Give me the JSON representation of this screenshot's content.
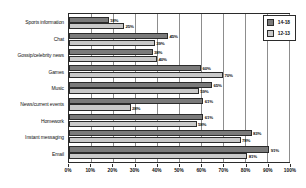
{
  "chart_data": {
    "type": "bar",
    "orientation": "horizontal",
    "title": "",
    "xlabel": "",
    "ylabel": "",
    "xlim": [
      0,
      100
    ],
    "grid": true,
    "legend_position": "top-right",
    "categories": [
      "Sports information",
      "Chat",
      "Gossip/celebrity news",
      "Games",
      "Music",
      "News/current events",
      "Homework",
      "Instant messaging",
      "Email"
    ],
    "series": [
      {
        "name": "14-18",
        "color": "#7a7a7a",
        "values": [
          18,
          45,
          38,
          60,
          65,
          61,
          61,
          83,
          91
        ],
        "labels": [
          "18%",
          "45%",
          "38%",
          "60%",
          "65%",
          "61%",
          "61%",
          "83%",
          "91%"
        ]
      },
      {
        "name": "12-13",
        "color": "#c9c9c9",
        "values": [
          25,
          39,
          40,
          70,
          59,
          28,
          58,
          78,
          81
        ],
        "labels": [
          "25%",
          "39%",
          "40%",
          "70%",
          "59%",
          "28%",
          "58%",
          "78%",
          "81%"
        ]
      }
    ],
    "xticks": [
      0,
      10,
      20,
      30,
      40,
      50,
      60,
      70,
      80,
      90,
      100
    ],
    "xtick_labels": [
      "0%",
      "10%",
      "20%",
      "30%",
      "40%",
      "50%",
      "60%",
      "70%",
      "80%",
      "90%",
      "100%"
    ]
  }
}
